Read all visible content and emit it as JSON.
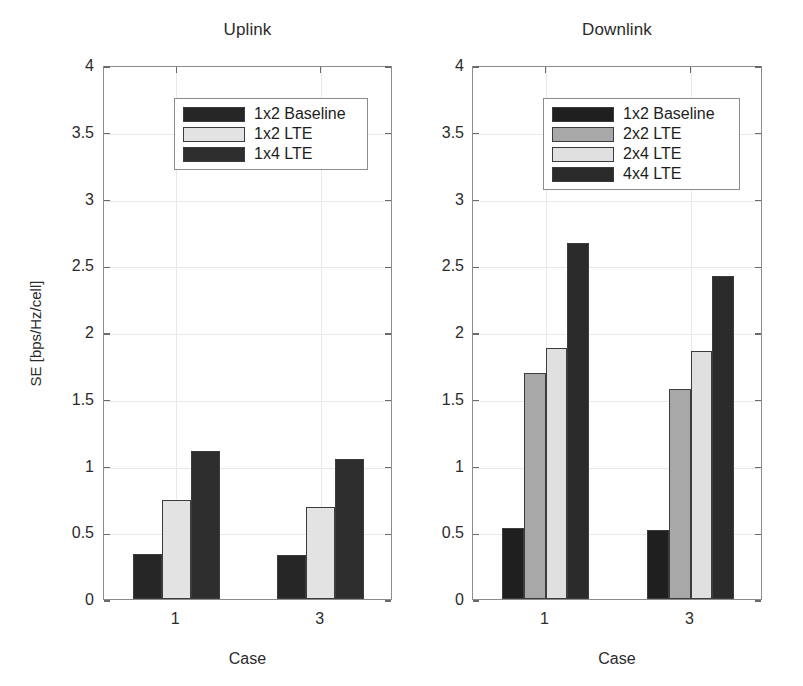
{
  "figure": {
    "caption": ""
  },
  "chart_data": [
    {
      "type": "bar",
      "title": "Uplink",
      "xlabel": "Case",
      "ylabel": "SE [bps/Hz/cell]",
      "categories": [
        "1",
        "3"
      ],
      "ylim": [
        0,
        4
      ],
      "yticks": [
        "0",
        "0.5",
        "1",
        "1.5",
        "2",
        "2.5",
        "3",
        "3.5",
        "4"
      ],
      "ytick_values": [
        0,
        0.5,
        1,
        1.5,
        2,
        2.5,
        3,
        3.5,
        4
      ],
      "grid": true,
      "legend_position": "upper center",
      "series": [
        {
          "name": "1x2 Baseline",
          "color": "#262626",
          "values": [
            0.34,
            0.33
          ]
        },
        {
          "name": "1x2 LTE",
          "color": "#e3e3e3",
          "values": [
            0.74,
            0.69
          ]
        },
        {
          "name": "1x4 LTE",
          "color": "#2e2e2e",
          "values": [
            1.11,
            1.05
          ]
        }
      ]
    },
    {
      "type": "bar",
      "title": "Downlink",
      "xlabel": "Case",
      "ylabel": "",
      "categories": [
        "1",
        "3"
      ],
      "ylim": [
        0,
        4
      ],
      "yticks": [
        "0",
        "0.5",
        "1",
        "1.5",
        "2",
        "2.5",
        "3",
        "3.5",
        "4"
      ],
      "ytick_values": [
        0,
        0.5,
        1,
        1.5,
        2,
        2.5,
        3,
        3.5,
        4
      ],
      "grid": true,
      "legend_position": "upper center",
      "series": [
        {
          "name": "1x2 Baseline",
          "color": "#1f1f1f",
          "values": [
            0.53,
            0.52
          ]
        },
        {
          "name": "2x2 LTE",
          "color": "#a8a8a8",
          "values": [
            1.69,
            1.57
          ]
        },
        {
          "name": "2x4 LTE",
          "color": "#e0e0e0",
          "values": [
            1.88,
            1.86
          ]
        },
        {
          "name": "4x4 LTE",
          "color": "#2b2b2b",
          "values": [
            2.67,
            2.42
          ]
        }
      ]
    }
  ]
}
